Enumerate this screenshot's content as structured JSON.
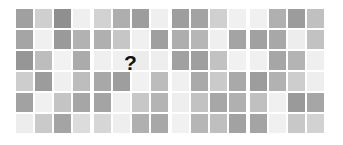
{
  "figure": {
    "type": "matrix-reasoning-puzzle",
    "background_color": "#ffffff",
    "panel_count": 4,
    "grid_rows": 6,
    "grid_cols": 4,
    "missing_marker": "?",
    "missing_marker_panel_index": 1,
    "missing_marker_row_index": 2,
    "palette": {
      "dark_gray": "#8d8d8d",
      "medium_gray": "#a3a3a3",
      "light_gray": "#c9c9c9",
      "pale_gray": "#e2e2e2",
      "near_white": "#f1f1f1",
      "white": "#fbfbfb",
      "marker_color": "#111111"
    },
    "panels": [
      {
        "name": "panel-1",
        "rows": [
          [
            "#a0a0a0",
            "#cfcfcf",
            "#8f8f8f",
            "#efefef"
          ],
          [
            "#a5a5a5",
            "#f0f0f0",
            "#9a9a9a",
            "#b2b2b2"
          ],
          [
            "#969696",
            "#bdbdbd",
            "#f2f2f2",
            "#ababab"
          ],
          [
            "#cdcdcd",
            "#9c9c9c",
            "#efefef",
            "#bdbdbd"
          ],
          [
            "#a2a2a2",
            "#f0f0f0",
            "#c4c4c4",
            "#a6a6a6"
          ],
          [
            "#ededed",
            "#cacaca",
            "#a4a4a4",
            "#dcdcdc"
          ]
        ]
      },
      {
        "name": "panel-2",
        "rows": [
          [
            "#d2d2d2",
            "#aeaeae",
            "#9d9d9d",
            "#efefef"
          ],
          [
            "#b0b0b0",
            "#c6c6c6",
            "#f0f0f0",
            "#9f9f9f"
          ],
          [
            "#efefef",
            "#f0f0f0",
            "#ececec",
            "#eeeeee"
          ],
          [
            "#a8a8a8",
            "#9e9e9e",
            "#f1f1f1",
            "#bcbcbc"
          ],
          [
            "#a4a4a4",
            "#f0f0f0",
            "#c7c7c7",
            "#b4b4b4"
          ],
          [
            "#d6d6d6",
            "#eeeeee",
            "#b0b0b0",
            "#a8a8a8"
          ]
        ]
      },
      {
        "name": "panel-3",
        "rows": [
          [
            "#9e9e9e",
            "#a3a3a3",
            "#d0d0d0",
            "#f0f0f0"
          ],
          [
            "#aeaeae",
            "#b6b6b6",
            "#efefef",
            "#a4a4a4"
          ],
          [
            "#a1a1a1",
            "#9f9f9f",
            "#c2c2c2",
            "#f1f1f1"
          ],
          [
            "#f0f0f0",
            "#aaaaaa",
            "#cacaca",
            "#a9a9a9"
          ],
          [
            "#eeeeee",
            "#c2c2c2",
            "#a7a7a7",
            "#b0b0b0"
          ],
          [
            "#f1f1f1",
            "#b6b6b6",
            "#bfbfbf",
            "#a2a2a2"
          ]
        ]
      },
      {
        "name": "panel-4",
        "rows": [
          [
            "#f0f0f0",
            "#b0b0b0",
            "#9c9c9c",
            "#c0c0c0"
          ],
          [
            "#a1a1a1",
            "#a8a8a8",
            "#ededed",
            "#c2c2c2"
          ],
          [
            "#f0f0f0",
            "#a6a6a6",
            "#b4b4b4",
            "#efefef"
          ],
          [
            "#9d9d9d",
            "#b2b2b2",
            "#cdcdcd",
            "#eeeeee"
          ],
          [
            "#c0c0c0",
            "#f0f0f0",
            "#9a9a9a",
            "#a6a6a6"
          ],
          [
            "#a4a4a4",
            "#f0f0f0",
            "#c8c8c8",
            "#d2d2d2"
          ]
        ]
      }
    ]
  }
}
